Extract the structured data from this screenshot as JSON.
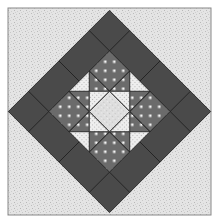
{
  "image": {
    "subject": "quilt block",
    "pattern": "star on point with dark border band",
    "colors": {
      "background_speckle": "#e2e2e2",
      "speckle_dot": "#c4c4c4",
      "dark_band": "#4a4a4a",
      "dotted_dark": "#6a6a6a",
      "dot": "#f2f2f2",
      "grid_light": "#e8e8e8",
      "grid_line": "#bdbdbd",
      "center_light": "#d8d8d8",
      "outline": "#222222",
      "frame": "#8a8a8a"
    }
  }
}
